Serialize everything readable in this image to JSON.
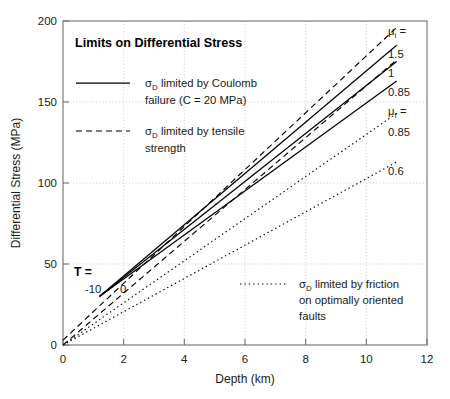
{
  "chart_data": {
    "type": "line",
    "title": "Limits on Differential Stress",
    "xlabel": "Depth (km)",
    "ylabel": "Differential Stress (MPa)",
    "xlim": [
      0,
      12
    ],
    "ylim": [
      0,
      200
    ],
    "xticks": [
      0,
      2,
      4,
      6,
      8,
      10,
      12
    ],
    "yticks": [
      0,
      50,
      100,
      150,
      200
    ],
    "grid": true,
    "legend_position": "upper-left",
    "series": [
      {
        "name": "Coulomb mu_i = 1.5",
        "style": "solid",
        "label": "1.5",
        "x": [
          1.2,
          11.0
        ],
        "y": [
          30,
          185
        ]
      },
      {
        "name": "Coulomb mu_i = 1",
        "style": "solid",
        "label": "1",
        "x": [
          1.2,
          11.0
        ],
        "y": [
          30,
          175
        ]
      },
      {
        "name": "Coulomb mu_i = 0.85",
        "style": "solid",
        "label": "0.85",
        "x": [
          1.2,
          11.0
        ],
        "y": [
          30,
          163
        ]
      },
      {
        "name": "Tensile strength T = -10",
        "style": "dashed",
        "label": "-10",
        "x": [
          0.0,
          11.0
        ],
        "y": [
          3,
          196
        ]
      },
      {
        "name": "Tensile strength T = 0",
        "style": "dashed",
        "label": "0",
        "x": [
          0.0,
          11.0
        ],
        "y": [
          0,
          176
        ]
      },
      {
        "name": "Friction mu_f = 0.85",
        "style": "dotted",
        "label": "0.85",
        "x": [
          0.0,
          11.0
        ],
        "y": [
          0,
          143
        ]
      },
      {
        "name": "Friction mu_f = 0.6",
        "style": "dotted",
        "label": "0.6",
        "x": [
          0.0,
          11.0
        ],
        "y": [
          0,
          113
        ]
      }
    ],
    "legend": [
      {
        "style": "solid",
        "line1_pre": "σ",
        "line1_sub": "D",
        "line1_post": " limited by Coulomb",
        "line2": "failure (C = 20 MPa)"
      },
      {
        "style": "dashed",
        "line1_pre": "σ",
        "line1_sub": "D",
        "line1_post": " limited by tensile",
        "line2": "strength"
      },
      {
        "style": "dotted",
        "line1_pre": "σ",
        "line1_sub": "D",
        "line1_post": " limited by friction",
        "line2": "on optimally oriented",
        "line3": "faults"
      }
    ],
    "annotations": {
      "tensile_group": "T =",
      "tensile_values": [
        "-10",
        "0"
      ],
      "mu_i_header_sym": "μ",
      "mu_i_header_sub": "i",
      "mu_i_header_eq": " =",
      "mu_i_values": [
        "1.5",
        "1",
        "0.85"
      ],
      "mu_f_header_sym": "μ",
      "mu_f_header_sub": "f",
      "mu_f_header_eq": " =",
      "mu_f_values": [
        "0.85",
        "0.6"
      ]
    }
  }
}
